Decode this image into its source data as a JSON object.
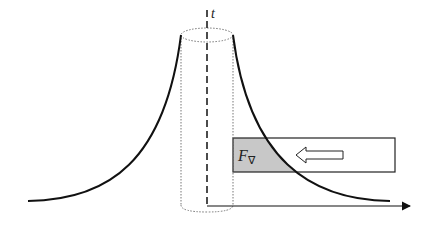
{
  "diagram": {
    "axis_label_vertical": "t",
    "force_label_main": "F",
    "force_label_sub": "∇",
    "colors": {
      "stroke": "#111111",
      "shaded_region": "#c8c8c8",
      "dotted": "#777777"
    },
    "elements": [
      "left-decay-curve",
      "right-decay-curve",
      "dotted-cylinder",
      "dashed-vertical-axis",
      "horizontal-axis-arrow",
      "force-box",
      "leftward-hollow-arrow"
    ]
  }
}
